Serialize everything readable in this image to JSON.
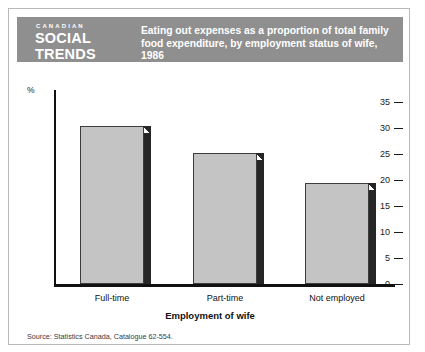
{
  "publication": {
    "eyebrow": "CANADIAN",
    "name_line1": "SOCIAL",
    "name_line2": "TRENDS"
  },
  "header": {
    "title_line1": "Eating out expenses as a proportion of total family",
    "title_line2": "food expenditure, by employment status of wife, 1986",
    "band_color": "#8f8f8f",
    "text_color": "#ffffff"
  },
  "source": "Source: Statistics Canada, Catalogue 62-554.",
  "axis": {
    "y_unit": "%",
    "y_ticks": [
      "35",
      "30",
      "25",
      "20",
      "15",
      "10",
      "5",
      "0"
    ],
    "x_title": "Employment of wife"
  },
  "chart_data": {
    "type": "bar",
    "title": "Eating out expenses as a proportion of total family food expenditure, by employment status of wife, 1986",
    "categories": [
      "Full-time",
      "Part-time",
      "Not employed"
    ],
    "values": [
      30.3,
      25.1,
      19.5
    ],
    "xlabel": "Employment of wife",
    "ylabel": "%",
    "ylim": [
      0,
      35
    ],
    "ytick_step": 5,
    "grid": false,
    "legend": "none",
    "bar_face_color": "#c4c4c4",
    "bar_shadow_color": "#262626",
    "bar_outline_color": "#3c3c3c"
  }
}
